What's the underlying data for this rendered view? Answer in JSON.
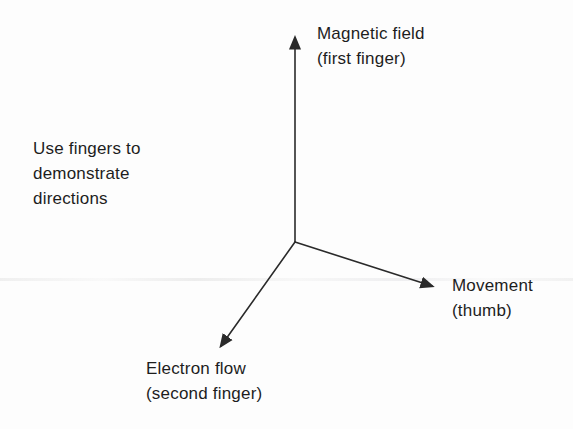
{
  "diagram": {
    "instruction": "Use fingers to\ndemonstrate\ndirections",
    "axes": {
      "up": {
        "label": "Magnetic field\n(first finger)"
      },
      "right": {
        "label": "Movement\n(thumb)"
      },
      "down_left": {
        "label": "Electron flow\n(second finger)"
      }
    },
    "colors": {
      "line": "#2a2a2a",
      "text": "#1d1d1d",
      "background": "#fdfdfd"
    }
  }
}
